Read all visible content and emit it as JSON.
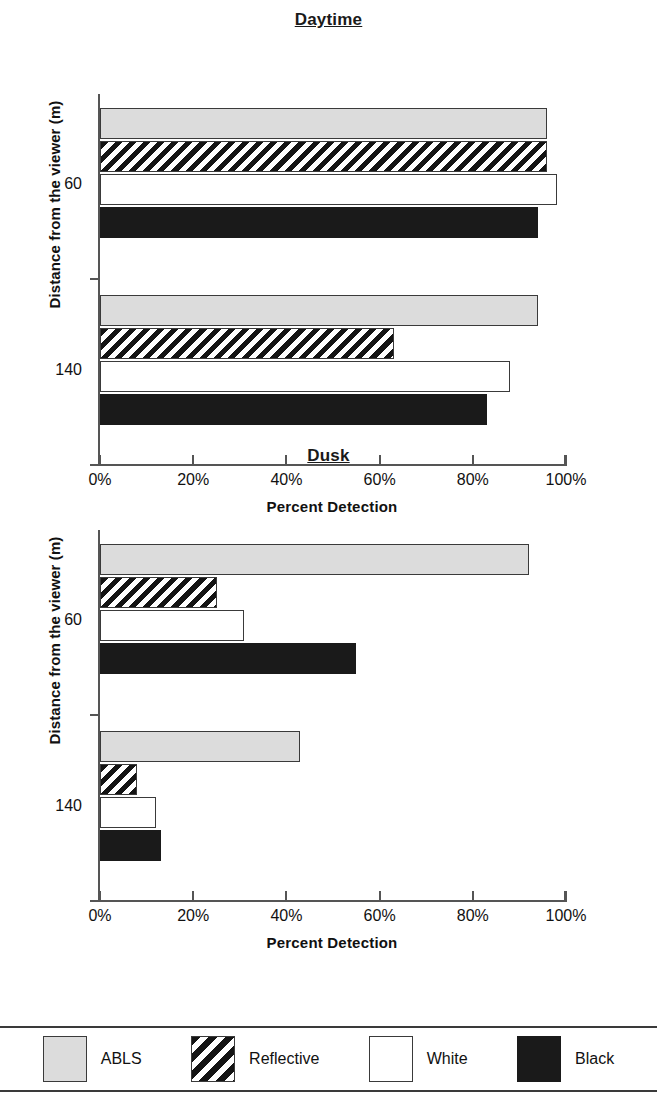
{
  "chart_data": [
    {
      "type": "bar",
      "title": "Daytime",
      "orientation": "horizontal",
      "xlabel": "Percent Detection",
      "ylabel": "Distance from the viewer (m)",
      "categories": [
        "60",
        "140"
      ],
      "xlim": [
        0,
        100
      ],
      "xticks": [
        0,
        20,
        40,
        60,
        80,
        100
      ],
      "xticklabels": [
        "0%",
        "20%",
        "40%",
        "60%",
        "80%",
        "100%"
      ],
      "grid": false,
      "legend_position": "bottom",
      "series": [
        {
          "name": "ABLS",
          "values": [
            96,
            94
          ]
        },
        {
          "name": "Reflective",
          "values": [
            96,
            63
          ]
        },
        {
          "name": "White",
          "values": [
            98,
            88
          ]
        },
        {
          "name": "Black",
          "values": [
            94,
            83
          ]
        }
      ]
    },
    {
      "type": "bar",
      "title": "Dusk",
      "orientation": "horizontal",
      "xlabel": "Percent Detection",
      "ylabel": "Distance from the viewer (m)",
      "categories": [
        "60",
        "140"
      ],
      "xlim": [
        0,
        100
      ],
      "xticks": [
        0,
        20,
        40,
        60,
        80,
        100
      ],
      "xticklabels": [
        "0%",
        "20%",
        "40%",
        "60%",
        "80%",
        "100%"
      ],
      "grid": false,
      "legend_position": "bottom",
      "series": [
        {
          "name": "ABLS",
          "values": [
            92,
            43
          ]
        },
        {
          "name": "Reflective",
          "values": [
            25,
            8
          ]
        },
        {
          "name": "White",
          "values": [
            31,
            12
          ]
        },
        {
          "name": "Black",
          "values": [
            55,
            13
          ]
        }
      ]
    }
  ],
  "panels": [
    {
      "title": "Daytime",
      "xlabel": "Percent Detection",
      "ylabel": "Distance from the viewer (m)",
      "xticklabels": [
        "0%",
        "20%",
        "40%",
        "60%",
        "80%",
        "100%"
      ],
      "yticklabels": [
        "60",
        "140"
      ],
      "bars": [
        {
          "series": "ABLS",
          "group": "60",
          "value": 96,
          "style": "s-ablsg"
        },
        {
          "series": "Reflective",
          "group": "60",
          "value": 96,
          "style": "s-hatch"
        },
        {
          "series": "White",
          "group": "60",
          "value": 98,
          "style": "s-white"
        },
        {
          "series": "Black",
          "group": "60",
          "value": 94,
          "style": "s-black"
        },
        {
          "series": "ABLS",
          "group": "140",
          "value": 94,
          "style": "s-ablsg"
        },
        {
          "series": "Reflective",
          "group": "140",
          "value": 63,
          "style": "s-hatch"
        },
        {
          "series": "White",
          "group": "140",
          "value": 88,
          "style": "s-white"
        },
        {
          "series": "Black",
          "group": "140",
          "value": 83,
          "style": "s-black"
        }
      ]
    },
    {
      "title": "Dusk",
      "xlabel": "Percent Detection",
      "ylabel": "Distance from the viewer (m)",
      "xticklabels": [
        "0%",
        "20%",
        "40%",
        "60%",
        "80%",
        "100%"
      ],
      "yticklabels": [
        "60",
        "140"
      ],
      "bars": [
        {
          "series": "ABLS",
          "group": "60",
          "value": 92,
          "style": "s-ablsg"
        },
        {
          "series": "Reflective",
          "group": "60",
          "value": 25,
          "style": "s-hatch"
        },
        {
          "series": "White",
          "group": "60",
          "value": 31,
          "style": "s-white"
        },
        {
          "series": "Black",
          "group": "60",
          "value": 55,
          "style": "s-black"
        },
        {
          "series": "ABLS",
          "group": "140",
          "value": 43,
          "style": "s-ablsg"
        },
        {
          "series": "Reflective",
          "group": "140",
          "value": 8,
          "style": "s-hatch"
        },
        {
          "series": "White",
          "group": "140",
          "value": 12,
          "style": "s-white"
        },
        {
          "series": "Black",
          "group": "140",
          "value": 13,
          "style": "s-black"
        }
      ]
    }
  ],
  "legend": {
    "items": [
      {
        "label": "ABLS",
        "style": "s-ablsg",
        "color": "#dcdcdc"
      },
      {
        "label": "Reflective",
        "style": "s-hatch",
        "color": "#141414"
      },
      {
        "label": "White",
        "style": "s-white",
        "color": "#ffffff"
      },
      {
        "label": "Black",
        "style": "s-black",
        "color": "#1a1a1a"
      }
    ]
  }
}
